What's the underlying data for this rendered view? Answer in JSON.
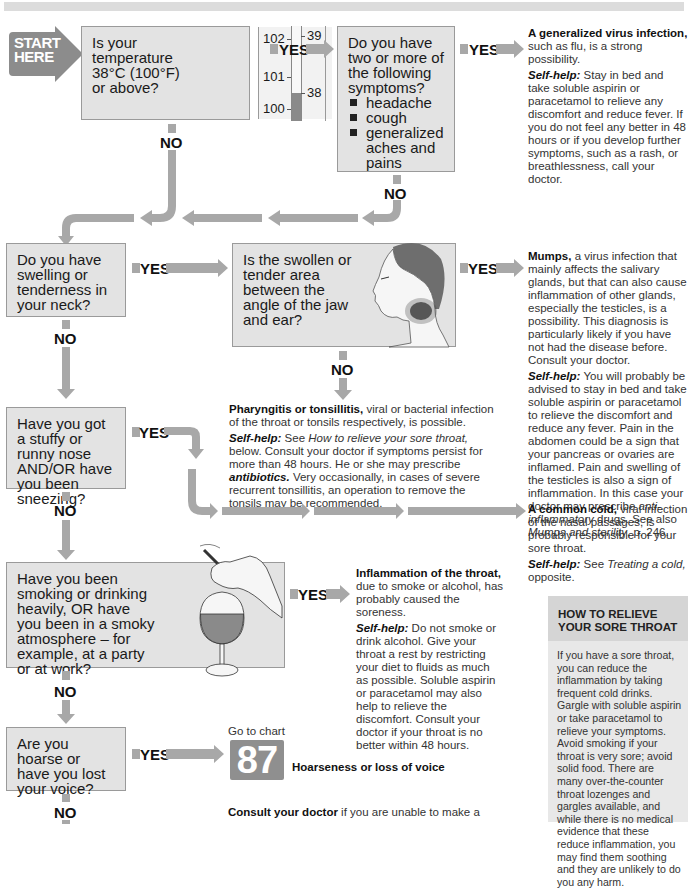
{
  "header": {
    "title_band": ""
  },
  "start": {
    "line1": "START",
    "line2": "HERE"
  },
  "questions": {
    "q1": {
      "text": "Is your temperature 38°C (100°F) or above?",
      "thermometer": {
        "fahrenheit_ticks": [
          "102",
          "101",
          "100"
        ],
        "celsius_ticks": [
          "39",
          "38"
        ]
      }
    },
    "q2": {
      "text": "Do you have two or more of the following symptoms?",
      "items": [
        "headache",
        "cough",
        "generalized aches and pains"
      ]
    },
    "q3": {
      "text": "Do you have swelling or tenderness in your neck?"
    },
    "q4": {
      "text": "Is the swollen or tender area between the angle of the jaw and ear?"
    },
    "q5": {
      "text": "Have you got a stuffy or runny nose AND/OR have you been sneezing?"
    },
    "q6": {
      "text": "Have you been smoking or drinking heavily, OR have you been in a smoky atmosphere – for example, at a party or at work?"
    },
    "q7": {
      "text": "Are you hoarse or have you lost your voice?"
    }
  },
  "labels": {
    "yes": "YES",
    "no": "NO"
  },
  "answers": {
    "flu": {
      "title": "A generalized virus infection,",
      "desc": " such as flu, is a strong possibility.",
      "selfhelp_label": "Self-help:",
      "selfhelp": " Stay in bed and take soluble aspirin or paracetamol to relieve any discomfort and reduce fever. If you do not feel any better in 48 hours or if you develop further symptoms, such as a rash, or breathlessness, call your doctor."
    },
    "mumps": {
      "title": "Mumps,",
      "desc": " a virus infection that mainly affects the salivary glands, but that can also cause inflammation of other glands, especially the testicles, is a possibility. This diagnosis is particularly likely if you have not had the disease before. Consult your doctor.",
      "selfhelp_label": "Self-help:",
      "selfhelp": " You will probably be advised to stay in bed and take soluble aspirin or paracetamol to relieve the discomfort and reduce any fever. Pain in the abdomen could be a sign that your pancreas or ovaries are inflamed. Pain and swelling of the testicles is also a sign of inflammation. In this case your doctor may prescribe ",
      "selfhelp_italic1": "anti-inflammatory",
      "selfhelp_mid": " drugs. See also ",
      "selfhelp_italic2": "Mumps and sterility",
      "selfhelp_end": ", p. 246."
    },
    "pharyngitis": {
      "title": "Pharyngitis or tonsillitis,",
      "desc": " viral or bacterial infection of the throat or tonsils respectively, is possible.",
      "selfhelp_label": "Self-help:",
      "selfhelp_pre": " See ",
      "selfhelp_italic1": "How to relieve your sore throat,",
      "selfhelp_mid": " below. Consult your doctor if symptoms persist for more than 48 hours. He or she may prescribe ",
      "selfhelp_bolditalic": "antibiotics.",
      "selfhelp_end": " Very occasionally, in cases of severe recurrent tonsillitis, an operation to remove the tonsils may be recommended."
    },
    "cold": {
      "title": "A common cold,",
      "desc": " viral infection of the nasal passages, is probably responsible for your sore throat.",
      "selfhelp_label": "Self-help:",
      "selfhelp_pre": " See ",
      "selfhelp_italic": "Treating a cold,",
      "selfhelp_end": " opposite."
    },
    "inflammation": {
      "title": "Inflammation of the throat,",
      "desc": " due to smoke or alcohol, has probably caused the soreness.",
      "selfhelp_label": "Self-help:",
      "selfhelp": " Do not smoke or drink alcohol. Give your throat a rest by restricting your diet to fluids as much as possible. Soluble aspirin or paracetamol may also help to relieve the discomfort. Consult your doctor if your throat is no better within 48 hours."
    },
    "goto": {
      "label": "Go to chart",
      "number": "87",
      "title": "Hoarseness or loss of voice"
    },
    "consult": {
      "title": "Consult your doctor",
      "desc": " if you are unable to make a"
    }
  },
  "howto": {
    "heading": "HOW TO RELIEVE YOUR SORE THROAT",
    "body": "If you have a sore throat, you can reduce the inflammation by taking frequent cold drinks. Gargle with soluble aspirin or take paracetamol to relieve your symptoms. Avoid smoking if your throat is very sore; avoid solid food. There are many over-the-counter throat lozenges and gargles available, and while there is no medical evidence that these reduce inflammation, you may find them soothing and they are unlikely to do you any harm."
  },
  "colors": {
    "box_fill": "#e3e3e3",
    "arrow": "#a8a8a8",
    "start": "#8c8c8c",
    "chart_badge": "#8f8f8f"
  }
}
